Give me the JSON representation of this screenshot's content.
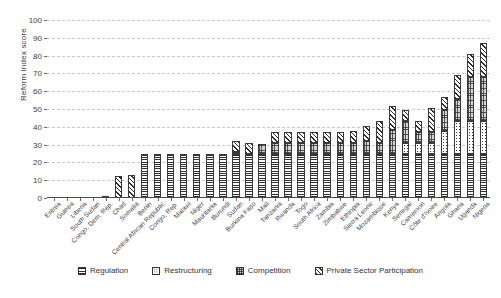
{
  "chart_data": {
    "type": "bar",
    "stacked": true,
    "title": "",
    "xlabel": "",
    "ylabel": "Reform index score",
    "ylim": [
      0,
      100
    ],
    "ytick_step": 10,
    "yticks": [
      0,
      10,
      20,
      30,
      40,
      50,
      60,
      70,
      80,
      90,
      100
    ],
    "grid": "horizontal-dashed",
    "legend_position": "bottom",
    "categories": [
      "Eritrea",
      "Guinea",
      "Liberia",
      "South Sudan",
      "Congo, Dem. Rep.",
      "Chad",
      "Somalia",
      "Benin",
      "Central African Republic",
      "Congo, Rep.",
      "Malawi",
      "Niger",
      "Mauritania",
      "Burundi",
      "Sudan",
      "Burkina Faso",
      "Mali",
      "Tanzania",
      "Rwanda",
      "Togo",
      "South Africa",
      "Zambia",
      "Zimbabwe",
      "Ethiopia",
      "Sierra Leone",
      "Mozambique",
      "Kenya",
      "Senegal",
      "Cameroon",
      "Côte d'Ivoire",
      "Angola",
      "Ghana",
      "Uganda",
      "Nigeria"
    ],
    "series": [
      {
        "name": "Regulation",
        "pattern": "horizontal-lines",
        "values": [
          0,
          0,
          0,
          0,
          0.6,
          0,
          0,
          25,
          25,
          25,
          25,
          25,
          25,
          25,
          25,
          25,
          25,
          25,
          25,
          25,
          25,
          25,
          25,
          25,
          25,
          25,
          25,
          25,
          25,
          25,
          25,
          25,
          25,
          25
        ]
      },
      {
        "name": "Restructuring",
        "pattern": "dotted",
        "values": [
          0,
          0,
          0,
          0,
          0,
          0,
          0,
          0,
          0,
          0,
          0,
          0,
          0,
          0,
          0,
          0,
          0,
          0,
          0,
          0,
          0,
          0,
          0,
          0,
          0,
          0,
          0,
          6,
          6,
          6,
          12.5,
          18,
          18,
          18
        ]
      },
      {
        "name": "Competition",
        "pattern": "checkered",
        "values": [
          0,
          0,
          0,
          0,
          0,
          0,
          0,
          0,
          0,
          0,
          0,
          0,
          0,
          0,
          0.7,
          0,
          5.5,
          6,
          6,
          6,
          6,
          6,
          6,
          6,
          7,
          6,
          13,
          12,
          6,
          6,
          12,
          12.5,
          25,
          25
        ]
      },
      {
        "name": "Private Sector Participation",
        "pattern": "diagonal-hatch",
        "values": [
          0,
          0,
          0,
          0,
          0,
          12.3,
          13,
          0,
          0,
          0,
          0,
          0,
          0,
          0,
          6,
          6,
          0,
          6,
          6,
          6,
          6,
          6,
          6,
          6.5,
          8.5,
          12.5,
          13.5,
          6.5,
          6.5,
          13.5,
          7.5,
          13.5,
          13,
          19
        ]
      }
    ],
    "totals": [
      0,
      0,
      0,
      0,
      0.6,
      12.3,
      13,
      25,
      25,
      25,
      25,
      25,
      25,
      25,
      31.7,
      31,
      30.5,
      37,
      37,
      37,
      37,
      37,
      37,
      37.5,
      40.5,
      43.5,
      51.5,
      49.5,
      37.5,
      50.5,
      57,
      69,
      81,
      87
    ],
    "legend": [
      {
        "label": "Regulation",
        "pattern": "horizontal-lines"
      },
      {
        "label": "Restructuring",
        "pattern": "dotted"
      },
      {
        "label": "Competition",
        "pattern": "checkered"
      },
      {
        "label": "Private Sector Participation",
        "pattern": "diagonal-hatch"
      }
    ]
  }
}
